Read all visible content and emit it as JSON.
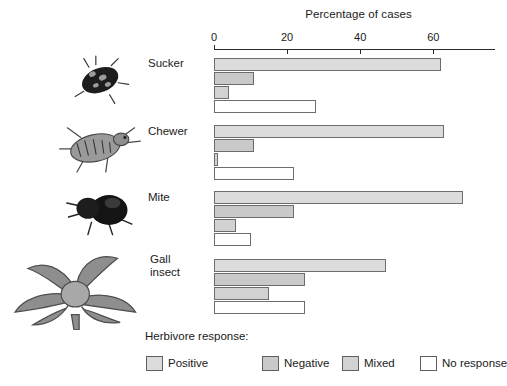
{
  "chart_data": {
    "type": "bar",
    "title": "",
    "xlabel": "Percentage of cases",
    "ylabel": "",
    "xlim": [
      0,
      77
    ],
    "xticks": [
      0,
      20,
      40,
      60
    ],
    "xticklabels": [
      "0",
      "20",
      "40",
      "60"
    ],
    "grid": false,
    "orientation": "horizontal",
    "legend_title": "Herbivore response:",
    "legend_position": "bottom",
    "categories": [
      "Sucker",
      "Chewer",
      "Mite",
      "Gall insect"
    ],
    "series": [
      {
        "name": "Positive",
        "values": [
          62,
          63,
          68,
          47
        ]
      },
      {
        "name": "Negative",
        "values": [
          11,
          11,
          22,
          25
        ]
      },
      {
        "name": "Mixed",
        "values": [
          4,
          1,
          6,
          15
        ]
      },
      {
        "name": "No response",
        "values": [
          28,
          22,
          10,
          25
        ]
      }
    ]
  },
  "axis": {
    "title": "Percentage of cases",
    "ticks": [
      {
        "label": "0",
        "value": 0
      },
      {
        "label": "20",
        "value": 20
      },
      {
        "label": "40",
        "value": 40
      },
      {
        "label": "60",
        "value": 60
      }
    ]
  },
  "groups": [
    {
      "label": "Sucker",
      "icon": "sucker-insect-illustration",
      "bars": [
        {
          "series": "Positive",
          "value": 62
        },
        {
          "series": "Negative",
          "value": 11
        },
        {
          "series": "Mixed",
          "value": 4
        },
        {
          "series": "No response",
          "value": 28
        }
      ]
    },
    {
      "label": "Chewer",
      "icon": "chewer-beetle-illustration",
      "bars": [
        {
          "series": "Positive",
          "value": 63
        },
        {
          "series": "Negative",
          "value": 11
        },
        {
          "series": "Mixed",
          "value": 1
        },
        {
          "series": "No response",
          "value": 22
        }
      ]
    },
    {
      "label": "Mite",
      "icon": "mite-illustration",
      "bars": [
        {
          "series": "Positive",
          "value": 68
        },
        {
          "series": "Negative",
          "value": 22
        },
        {
          "series": "Mixed",
          "value": 6
        },
        {
          "series": "No response",
          "value": 10
        }
      ]
    },
    {
      "label": "Gall\ninsect",
      "icon": "gall-insect-plant-illustration",
      "bars": [
        {
          "series": "Positive",
          "value": 47
        },
        {
          "series": "Negative",
          "value": 25
        },
        {
          "series": "Mixed",
          "value": 15
        },
        {
          "series": "No response",
          "value": 25
        }
      ]
    }
  ],
  "legend": {
    "title": "Herbivore response:",
    "items": [
      {
        "label": "Positive",
        "color": "#dcdcdc"
      },
      {
        "label": "Negative",
        "color": "#c9c9c9"
      },
      {
        "label": "Mixed",
        "color": "#d2d2d2"
      },
      {
        "label": "No response",
        "color": "#ffffff"
      }
    ]
  }
}
